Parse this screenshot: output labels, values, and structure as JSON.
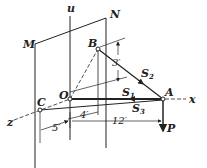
{
  "figure": {
    "labels": {
      "u": "u",
      "N": "N",
      "M": "M",
      "B": "B",
      "O": "O",
      "C": "C",
      "A": "A",
      "x": "x",
      "z": "z",
      "P": "P",
      "S1": "S",
      "S1_sub": "1",
      "S2": "S",
      "S2_sub": "2",
      "S3": "S",
      "S3_sub": "3"
    },
    "dimensions": {
      "d_vertical": "3′",
      "d_4": "4′",
      "d_5": "5′",
      "d_12": "12′"
    },
    "colors": {
      "ink": "#222222",
      "background": "#ffffff"
    }
  }
}
